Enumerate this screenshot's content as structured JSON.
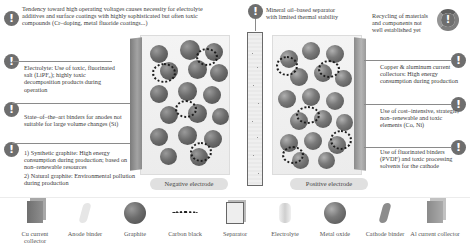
{
  "diagram": {
    "type": "lithium-ion battery cell schematic with sustainability issues",
    "electrodes": {
      "negative_label": "Negative electrode",
      "positive_label": "Positive electrode"
    },
    "warnings_left": [
      {
        "id": "high-voltage",
        "text": "Tendency toward high operating voltages causes necessity for electrolyte additives and surface coatings with highly sophisticated but often toxic compounds (Cr–doping, metal fluoride coatings...)"
      },
      {
        "id": "electrolyte",
        "text": "Electrolyte: Use of toxic, fluorinated salt (LiPF₆); highly toxic decomposition products during operation"
      },
      {
        "id": "anode-binder",
        "text": "State–of–the–art binders for anodes not suitable for large volume changes (Si)"
      },
      {
        "id": "graphite",
        "items": [
          "1) Synthetic graphite: High energy consumption during production; based on non–renewable resources",
          "2) Natural graphite: Environmental pollution during production"
        ]
      }
    ],
    "warnings_top": [
      {
        "id": "separator",
        "text": "Mineral oil–based separator with limited thermal stability"
      },
      {
        "id": "recycling",
        "text": "Recycling of materials and components not well established yet"
      }
    ],
    "warnings_right": [
      {
        "id": "current-collectors",
        "text": "Copper & aluminum current collectors: High energy consumption during production"
      },
      {
        "id": "cathode-elements",
        "text": "Use of cost–intensive, strategic, non–renewable and toxic elements (Co, Ni)"
      },
      {
        "id": "cathode-binder",
        "text": "Use of fluorinated binders (PVDF) and toxic processing solvents for the cathode"
      }
    ],
    "legend": [
      {
        "icon": "cu-collector-icon",
        "label": "Cu current collector"
      },
      {
        "icon": "anode-binder-icon",
        "label": "Anode binder"
      },
      {
        "icon": "graphite-icon",
        "label": "Graphite"
      },
      {
        "icon": "carbon-black-icon",
        "label": "Carbon black"
      },
      {
        "icon": "separator-icon",
        "label": "Separator"
      },
      {
        "icon": "electrolyte-icon",
        "label": "Electrolyte"
      },
      {
        "icon": "metal-oxide-icon",
        "label": "Metal oxide"
      },
      {
        "icon": "cathode-binder-icon",
        "label": "Cathode binder"
      },
      {
        "icon": "al-collector-icon",
        "label": "Al current collector"
      }
    ],
    "colors": {
      "warning_icon": "#6e6e6e",
      "lines": "#8a8a8a",
      "text": "#3b3b3b"
    }
  }
}
